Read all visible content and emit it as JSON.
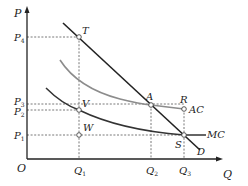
{
  "diagram": {
    "type": "economics-cost-curves",
    "axes": {
      "y_label": "P",
      "x_label": "Q",
      "origin_label": "O"
    },
    "price_levels": [
      {
        "label": "P",
        "sub": "4",
        "y": 37
      },
      {
        "label": "P",
        "sub": "3",
        "y": 104
      },
      {
        "label": "P",
        "sub": "2",
        "y": 110
      },
      {
        "label": "P",
        "sub": "1",
        "y": 135
      }
    ],
    "quantity_levels": [
      {
        "label": "Q",
        "sub": "1",
        "x": 79
      },
      {
        "label": "Q",
        "sub": "2",
        "x": 151
      },
      {
        "label": "Q",
        "sub": "3",
        "x": 184
      }
    ],
    "points": [
      {
        "label": "T",
        "x": 79,
        "y": 37
      },
      {
        "label": "A",
        "x": 151,
        "y": 105
      },
      {
        "label": "V",
        "x": 79,
        "y": 110
      },
      {
        "label": "R",
        "x": 184,
        "y": 109
      },
      {
        "label": "W",
        "x": 79,
        "y": 135
      },
      {
        "label": "S",
        "x": 184,
        "y": 135
      }
    ],
    "curves": [
      {
        "label": "D",
        "name": "demand",
        "color": "#222222"
      },
      {
        "label": "AC",
        "name": "average-cost",
        "color": "#8c8c8c"
      },
      {
        "label": "MC",
        "name": "marginal-cost",
        "color": "#333333"
      }
    ],
    "labels": {
      "P": "P",
      "Q": "Q",
      "O": "O",
      "T": "T",
      "A": "A",
      "V": "V",
      "R": "R",
      "W": "W",
      "S": "S",
      "D": "D",
      "AC": "AC",
      "MC": "MC",
      "P4": "P",
      "P4sub": "4",
      "P3": "P",
      "P3sub": "3",
      "P2": "P",
      "P2sub": "2",
      "P1": "P",
      "P1sub": "1",
      "Q1": "Q",
      "Q1sub": "1",
      "Q2": "Q",
      "Q2sub": "2",
      "Q3": "Q",
      "Q3sub": "3"
    }
  }
}
